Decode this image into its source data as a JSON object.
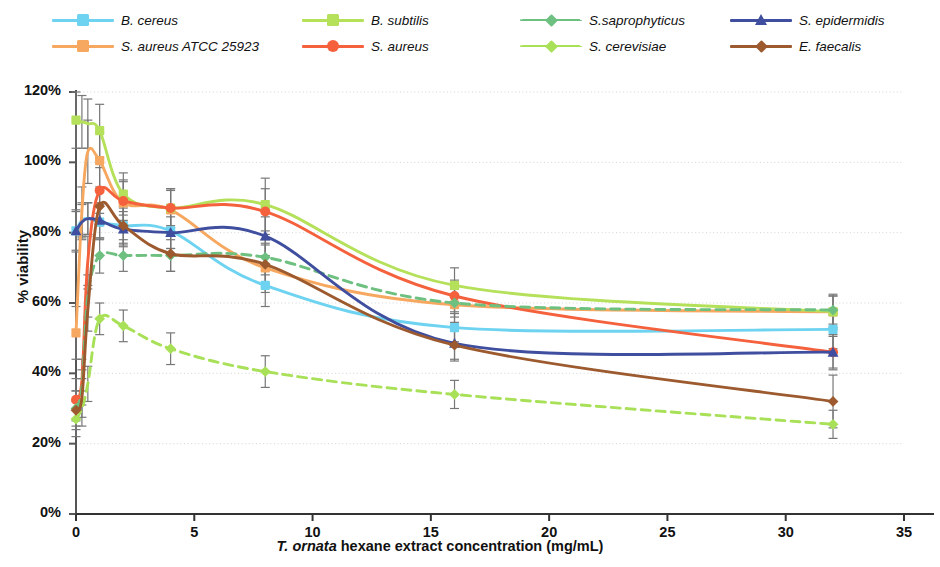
{
  "chart_data": {
    "type": "line",
    "title": "",
    "xlabel": "T. ornata hexane extract concentration (mg/mL)",
    "xlabel_italic_part": "T. ornata",
    "xlabel_rest": " hexane extract concentration (mg/mL)",
    "ylabel": "% viability",
    "xlim": [
      0,
      35
    ],
    "ylim": [
      0,
      120
    ],
    "xticks": [
      0,
      5,
      10,
      15,
      20,
      25,
      30,
      35
    ],
    "xtick_labels": [
      "0",
      "5",
      "10",
      "15",
      "20",
      "25",
      "30",
      "35"
    ],
    "yticks": [
      0,
      20,
      40,
      60,
      80,
      100,
      120
    ],
    "ytick_labels": [
      "0%",
      "20%",
      "40%",
      "60%",
      "80%",
      "100%",
      "120%"
    ],
    "grid": "horizontal-dotted",
    "legend_position": "top",
    "x": [
      0,
      0.25,
      0.5,
      1,
      2,
      4,
      8,
      16,
      32
    ],
    "series": [
      {
        "name": "B. cereus",
        "color": "#6DD3F0",
        "marker": "square",
        "linestyle": "solid",
        "values": [
          80.5,
          83.5,
          84.0,
          83.0,
          82.0,
          80.5,
          65.0,
          53.0,
          52.5
        ],
        "errors": [
          6.0,
          5.0,
          4.5,
          5.0,
          5.5,
          5.0,
          6.0,
          4.0,
          5.5
        ]
      },
      {
        "name": "S. aureus ATCC 25923",
        "color": "#F7A860",
        "marker": "square",
        "linestyle": "solid",
        "values": [
          51.5,
          86.0,
          103.0,
          100.5,
          88.5,
          86.5,
          70.0,
          59.5,
          57.5
        ],
        "errors": [
          7.5,
          7.0,
          9.0,
          8.0,
          6.5,
          6.0,
          7.0,
          5.0,
          5.0
        ]
      },
      {
        "name": "B. subtilis",
        "color": "#B5E05A",
        "marker": "square",
        "linestyle": "solid",
        "values": [
          112.0,
          111.5,
          111.0,
          109.0,
          91.0,
          87.0,
          88.0,
          65.0,
          57.5
        ],
        "errors": [
          8.0,
          7.5,
          7.0,
          7.5,
          6.0,
          5.5,
          7.5,
          5.0,
          4.5
        ]
      },
      {
        "name": "S. aureus",
        "color": "#F4613C",
        "marker": "circle",
        "linestyle": "solid",
        "values": [
          32.5,
          38.0,
          72.0,
          92.0,
          89.0,
          87.0,
          86.0,
          62.0,
          46.0
        ],
        "errors": [
          6.0,
          6.0,
          7.0,
          6.5,
          5.5,
          5.0,
          6.5,
          4.5,
          5.0
        ]
      },
      {
        "name": "S.saprophyticus",
        "color": "#6DC080",
        "marker": "diamond",
        "linestyle": "dashed",
        "values": [
          30.0,
          36.0,
          62.0,
          73.5,
          73.5,
          73.5,
          73.0,
          60.0,
          58.0
        ],
        "errors": [
          5.0,
          5.0,
          6.0,
          5.0,
          4.5,
          4.5,
          5.0,
          4.0,
          4.0
        ]
      },
      {
        "name": "S. cerevisiae",
        "color": "#A8E057",
        "marker": "diamond",
        "linestyle": "dashed",
        "values": [
          27.0,
          30.0,
          37.0,
          55.5,
          53.5,
          47.0,
          40.5,
          34.0,
          25.5
        ],
        "errors": [
          5.0,
          5.0,
          5.0,
          4.5,
          4.5,
          4.5,
          4.5,
          4.0,
          4.0
        ]
      },
      {
        "name": "S. epidermidis",
        "color": "#3F4E9E",
        "marker": "triangle",
        "linestyle": "solid",
        "values": [
          80.5,
          83.0,
          84.0,
          83.5,
          81.0,
          80.0,
          79.0,
          48.5,
          46.0
        ],
        "errors": [
          5.5,
          5.0,
          4.5,
          5.0,
          5.0,
          4.5,
          5.5,
          4.5,
          4.5
        ]
      },
      {
        "name": "E. faecalis",
        "color": "#9C5A2E",
        "marker": "diamond",
        "linestyle": "solid",
        "values": [
          29.5,
          33.0,
          58.0,
          87.5,
          82.0,
          74.0,
          71.0,
          48.0,
          32.0
        ],
        "errors": [
          5.5,
          5.5,
          6.0,
          5.5,
          5.0,
          5.0,
          5.5,
          4.5,
          7.5
        ]
      }
    ]
  },
  "legend": {
    "items": [
      {
        "label": "B. cereus",
        "color": "#6DD3F0",
        "marker": "square",
        "linestyle": "solid",
        "row": 0,
        "col": 0
      },
      {
        "label": "S. aureus ATCC 25923",
        "color": "#F7A860",
        "marker": "square",
        "linestyle": "solid",
        "row": 1,
        "col": 0
      },
      {
        "label": "B. subtilis",
        "color": "#B5E05A",
        "marker": "square",
        "linestyle": "solid",
        "row": 0,
        "col": 1
      },
      {
        "label": "S. aureus",
        "color": "#F4613C",
        "marker": "circle",
        "linestyle": "solid",
        "row": 1,
        "col": 1
      },
      {
        "label": "S.saprophyticus",
        "color": "#6DC080",
        "marker": "diamond",
        "linestyle": "dashed",
        "row": 0,
        "col": 2
      },
      {
        "label": "S. cerevisiae",
        "color": "#A8E057",
        "marker": "diamond",
        "linestyle": "dashed",
        "row": 1,
        "col": 2
      },
      {
        "label": "S. epidermidis",
        "color": "#3F4E9E",
        "marker": "triangle",
        "linestyle": "solid",
        "row": 0,
        "col": 3
      },
      {
        "label": "E. faecalis",
        "color": "#9C5A2E",
        "marker": "diamond",
        "linestyle": "solid",
        "row": 1,
        "col": 3
      }
    ]
  },
  "style": {
    "axis_color": "#555555",
    "grid_color": "#cfcfcf",
    "errorbar_color": "#777777",
    "background": "#ffffff"
  }
}
